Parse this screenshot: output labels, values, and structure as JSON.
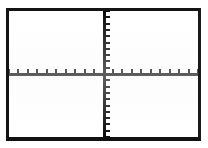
{
  "screen": {
    "device": "graphing-calculator",
    "title": "Graph Screen",
    "background_color": "#ffffff",
    "frame_color": "#141414"
  },
  "chart_data": {
    "type": "scatter",
    "title": "",
    "subtitle": "",
    "xlabel": "",
    "ylabel": "",
    "series": [],
    "x": [],
    "values": [],
    "xlim": [
      -10,
      10
    ],
    "ylim": [
      -10,
      10
    ],
    "xscl": 1,
    "yscl": 1,
    "x_tick_values": [
      -10,
      -9,
      -8,
      -7,
      -6,
      -5,
      -4,
      -3,
      -2,
      -1,
      1,
      2,
      3,
      4,
      5,
      6,
      7,
      8,
      9,
      10
    ],
    "y_tick_values": [
      -10,
      -9,
      -8,
      -7,
      -6,
      -5,
      -4,
      -3,
      -2,
      -1,
      1,
      2,
      3,
      4,
      5,
      6,
      7,
      8,
      9,
      10
    ],
    "x_tick_labels": [],
    "y_tick_labels": [],
    "legend": [],
    "legend_position": "none",
    "grid": false,
    "axes_visible": true,
    "annotations": [],
    "axis_color": "#0d0d0d",
    "origin_fraction": {
      "x": 0.5,
      "y": 0.5
    }
  }
}
